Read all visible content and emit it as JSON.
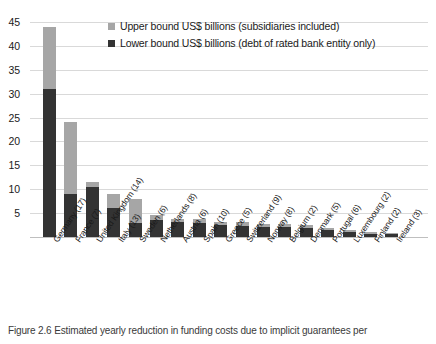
{
  "chart_data": {
    "type": "bar",
    "stacked": true,
    "title": "",
    "xlabel": "",
    "ylabel": "",
    "ylim": [
      0,
      45
    ],
    "ytick_step": 5,
    "yticks": [
      5,
      10,
      15,
      20,
      25,
      30,
      35,
      40,
      45
    ],
    "grid": true,
    "legend_position": "top-center",
    "categories": [
      "Germany (17)",
      "France (7)",
      "United Kingdom (14)",
      "Italy (13)",
      "Sweden (6)",
      "Netherlands (8)",
      "Austria (6)",
      "Spain (10)",
      "Greece (5)",
      "Switzerland (9)",
      "Norway (8)",
      "Belgium (2)",
      "Denmark (5)",
      "Portugal (6)",
      "Luxembourg (2)",
      "Finland (2)",
      "Ireland (3)"
    ],
    "series": [
      {
        "name": "Lower bound US$ billions (debt of rated bank entity only)",
        "color": "#333333",
        "values": [
          31.0,
          9.0,
          10.5,
          6.0,
          3.0,
          3.6,
          3.2,
          3.0,
          2.6,
          2.4,
          2.2,
          2.0,
          1.9,
          1.4,
          1.0,
          0.7,
          0.6
        ]
      },
      {
        "name": "Upper bound US$ billions (subsidiaries included)",
        "color": "#a6a6a6",
        "values": [
          13.0,
          15.0,
          1.0,
          3.0,
          5.0,
          1.0,
          0.6,
          0.7,
          0.6,
          0.7,
          0.6,
          0.8,
          0.6,
          0.5,
          0.5,
          0.3,
          0.3
        ]
      }
    ]
  },
  "legend": {
    "items": [
      {
        "label": "Upper bound US$ billions (subsidiaries included)",
        "color": "#a6a6a6"
      },
      {
        "label": "Lower bound US$ billions (debt of rated bank entity only)",
        "color": "#333333"
      }
    ]
  },
  "caption": {
    "text": "Figure 2.6 Estimated yearly reduction in funding costs due to implicit guarantees per"
  }
}
